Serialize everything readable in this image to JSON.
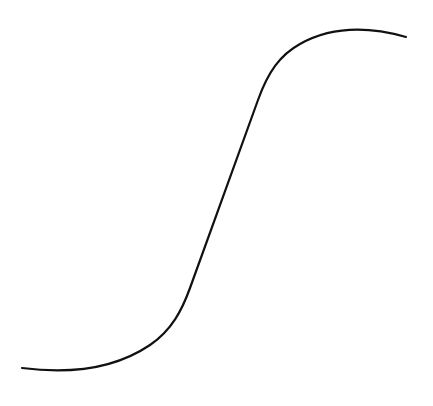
{
  "diagram": {
    "title": "",
    "shape": "s-curve",
    "colors": {
      "stroke": "#111111",
      "background": "#ffffff"
    },
    "labels": []
  }
}
